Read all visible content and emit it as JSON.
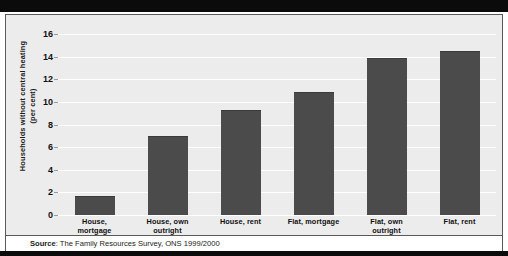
{
  "figure": {
    "background_color": "#ececec",
    "bar_color": "#4b4b4b",
    "gridline_color": "#ffffff",
    "frame_color": "#0b0b0b"
  },
  "source": {
    "prefix": "Source",
    "separator": ": ",
    "text": "The Family Resources Survey, ONS 1999/2000"
  },
  "chart_data": {
    "type": "bar",
    "title": "",
    "subtitle": "",
    "xlabel": "",
    "ylabel": "Households without central heating (per cent)",
    "ylabel_lines": [
      "Households without central heating",
      "(per cent)"
    ],
    "categories": [
      "House, mortgage",
      "House, own outright",
      "House, rent",
      "Flat, mortgage",
      "Flat, own outright",
      "Flat, rent"
    ],
    "category_lines": [
      [
        "House,",
        "mortgage"
      ],
      [
        "House, own",
        "outright"
      ],
      [
        "House, rent",
        ""
      ],
      [
        "Flat, mortgage",
        ""
      ],
      [
        "Flat, own",
        "outright"
      ],
      [
        "Flat, rent",
        ""
      ]
    ],
    "values": [
      1.6,
      6.9,
      9.2,
      10.8,
      13.8,
      14.4
    ],
    "ylim": [
      0,
      17
    ],
    "yticks": [
      0,
      2,
      4,
      6,
      8,
      10,
      12,
      14,
      16
    ],
    "ytick_labels": [
      "0",
      "2",
      "4",
      "6",
      "8",
      "10",
      "12",
      "14",
      "16"
    ],
    "grid": true,
    "grid_axis": "y",
    "legend": false,
    "legend_position": "none"
  }
}
